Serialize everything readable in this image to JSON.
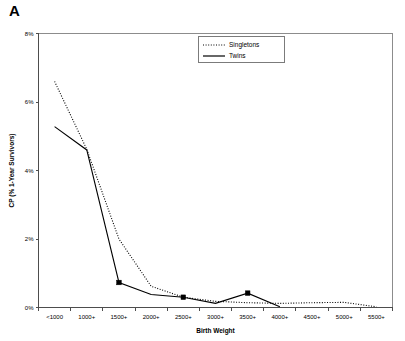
{
  "panel": {
    "label": "A"
  },
  "chart_data": {
    "type": "line",
    "title": "",
    "xlabel": "Birth Weight",
    "ylabel": "CP (% 1-Year Survivors)",
    "categories": [
      "<1000",
      "1000+",
      "1500+",
      "2000+",
      "2500+",
      "3000+",
      "3500+",
      "4000+",
      "4500+",
      "5000+",
      "5500+"
    ],
    "ylim": [
      0,
      8
    ],
    "yticks": [
      0,
      2,
      4,
      6,
      8
    ],
    "ytick_labels": [
      "0%",
      "2%",
      "4%",
      "6%",
      "8%"
    ],
    "grid": false,
    "legend_position": "top-center",
    "series": [
      {
        "name": "Singletons",
        "style": "dotted",
        "markers": false,
        "values": [
          6.6,
          4.62,
          2.0,
          0.62,
          0.3,
          0.18,
          0.14,
          0.12,
          0.14,
          0.15,
          0.02
        ]
      },
      {
        "name": "Twins",
        "style": "solid",
        "markers": true,
        "values": [
          5.28,
          4.6,
          0.73,
          0.38,
          0.3,
          0.12,
          0.42,
          0.02,
          null,
          null,
          null
        ]
      }
    ]
  },
  "legend": {
    "entries": [
      {
        "label": "Singletons",
        "style": "dotted"
      },
      {
        "label": "Twins",
        "style": "solid"
      }
    ]
  }
}
